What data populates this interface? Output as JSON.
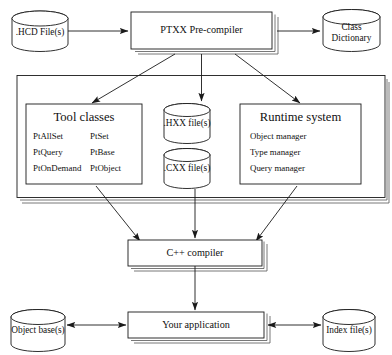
{
  "diagram": {
    "type": "flow-diagram",
    "background_color": "#ffffff",
    "line_color": "#1a1a1a",
    "shadow_color": "#555555"
  },
  "nodes": {
    "hcd_files": {
      "label": "HCD File(s)",
      "label_full": ".HCD File(s)",
      "shape": "cylinder"
    },
    "precompiler": {
      "label": "PTXX Pre-compiler",
      "shape": "box-3d"
    },
    "class_dictionary": {
      "line1": "Class",
      "line2": "Dictionary",
      "shape": "cylinder"
    },
    "tool_classes": {
      "heading": "Tool classes",
      "shape": "box",
      "items_left": [
        "PtAllSet",
        "PtQuery",
        "PtOnDemand"
      ],
      "items_right": [
        "PtSet",
        "PtBase",
        "PtObject"
      ]
    },
    "hxx_files": {
      "label": ".HXX file(s)",
      "shape": "cylinder"
    },
    "cxx_files": {
      "label": ".CXX file(s)",
      "shape": "cylinder"
    },
    "runtime_system": {
      "heading": "Runtime system",
      "shape": "box",
      "items": [
        "Object manager",
        "Type manager",
        "Query manager"
      ]
    },
    "cpp_compiler": {
      "label": "C++ compiler",
      "shape": "box-3d"
    },
    "your_application": {
      "label": "Your application",
      "shape": "box-3d"
    },
    "object_bases": {
      "label": "Object base(s)",
      "shape": "cylinder"
    },
    "index_files": {
      "label": "Index file(s)",
      "shape": "cylinder"
    }
  },
  "edges": [
    {
      "from": "hcd_files",
      "to": "precompiler",
      "style": "arrow"
    },
    {
      "from": "precompiler",
      "to": "class_dictionary",
      "style": "arrow"
    },
    {
      "from": "precompiler",
      "to": "tool_classes",
      "style": "arrow"
    },
    {
      "from": "precompiler",
      "to": "hxx_files",
      "style": "arrow"
    },
    {
      "from": "precompiler",
      "to": "runtime_system",
      "style": "arrow"
    },
    {
      "from": "tool_classes",
      "to": "cpp_compiler",
      "style": "arrow"
    },
    {
      "from": "cxx_files",
      "to": "cpp_compiler",
      "style": "arrow"
    },
    {
      "from": "runtime_system",
      "to": "cpp_compiler",
      "style": "arrow"
    },
    {
      "from": "cpp_compiler",
      "to": "your_application",
      "style": "arrow"
    },
    {
      "from": "object_bases",
      "to": "your_application",
      "style": "double-arrow"
    },
    {
      "from": "index_files",
      "to": "your_application",
      "style": "double-arrow"
    }
  ]
}
